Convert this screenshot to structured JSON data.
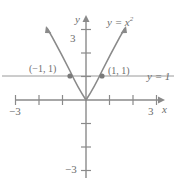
{
  "figure": {
    "colors": {
      "axis": "#8a8a8a",
      "curve": "#8a8a8a",
      "line": "#9a9a9a",
      "text": "#6d6d6d",
      "point": "#7a7a7a",
      "background": "#ffffff"
    }
  },
  "axes": {
    "x_axis_name": "x",
    "y_axis_name": "y",
    "x_ticks": [
      {
        "value": -3,
        "label": "−3"
      },
      {
        "value": -2,
        "label": ""
      },
      {
        "value": -1,
        "label": ""
      },
      {
        "value": 1,
        "label": ""
      },
      {
        "value": 2,
        "label": ""
      },
      {
        "value": 3,
        "label": "3"
      }
    ],
    "y_ticks": [
      {
        "value": 3,
        "label": "3"
      },
      {
        "value": 2,
        "label": ""
      },
      {
        "value": 1,
        "label": ""
      },
      {
        "value": -1,
        "label": ""
      },
      {
        "value": -2,
        "label": ""
      },
      {
        "value": -3,
        "label": "−3"
      }
    ],
    "xlim": [
      -3.4,
      3.4
    ],
    "ylim": [
      -3.6,
      3.6
    ]
  },
  "curves": [
    {
      "name": "parabola",
      "label_text": "y = x",
      "label_exponent": "2",
      "equation": "y = x^2",
      "arrows": "both-ends"
    },
    {
      "name": "horizontal-line",
      "label": "y = 1",
      "equation": "y = 1",
      "y_value": 1
    }
  ],
  "points": [
    {
      "label": "(−1, 1)",
      "x": -1,
      "y": 1
    },
    {
      "label": "(1, 1)",
      "x": 1,
      "y": 1
    }
  ]
}
